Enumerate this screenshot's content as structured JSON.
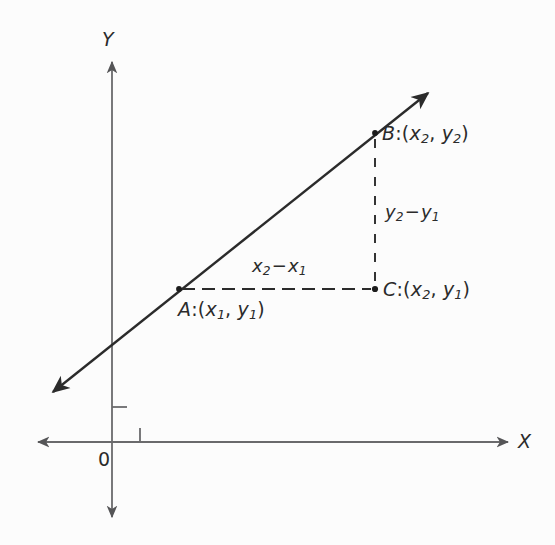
{
  "figure": {
    "kind": "coordinate-geometry-slope-diagram",
    "background_color": "#fcfcfc",
    "ink_color": "#2b2b2b",
    "width": 555,
    "height": 545
  },
  "axes": {
    "x_label": "X",
    "y_label": "Y",
    "origin_label": "0",
    "x_axis": {
      "x1": 38,
      "x2": 508,
      "y": 442,
      "arrows": "both"
    },
    "y_axis": {
      "y1": 62,
      "y2": 517,
      "x": 112,
      "arrows": "both"
    },
    "ticks": [
      {
        "name": "y-axis-tick",
        "axis": "y",
        "x": 112,
        "y": 407,
        "length": 14,
        "direction": "right"
      },
      {
        "name": "x-axis-tick",
        "axis": "x",
        "x": 140,
        "y": 442,
        "length": 14,
        "direction": "up"
      }
    ]
  },
  "line": {
    "name": "secant-line-through-A-and-B",
    "from": {
      "x": 53,
      "y": 392
    },
    "to": {
      "x": 428,
      "y": 93
    },
    "arrows": "both",
    "stroke_width": 2.4
  },
  "points": [
    {
      "id": "A",
      "cx": 179,
      "cy": 289,
      "label_prefix": "A",
      "coord_x": "x",
      "coord_x_sub": "1",
      "coord_y": "y",
      "coord_y_sub": "1"
    },
    {
      "id": "B",
      "cx": 375,
      "cy": 133,
      "label_prefix": "B",
      "coord_x": "x",
      "coord_x_sub": "2",
      "coord_y": "y",
      "coord_y_sub": "2"
    },
    {
      "id": "C",
      "cx": 375,
      "cy": 289,
      "label_prefix": "C",
      "coord_x": "x",
      "coord_x_sub": "2",
      "coord_y": "y",
      "coord_y_sub": "1"
    }
  ],
  "labels": {
    "point_a": "A:(x1, y1)",
    "point_b": "B:(x2, y2)",
    "point_c": "C:(x2, y1)",
    "delta_x": "x2 - x1",
    "delta_y": "y2 - y1",
    "separator_colon": ":",
    "separator_comma": ",",
    "paren_open": "(",
    "paren_close": ")",
    "minus_sign": "−"
  },
  "dashed_segments": [
    {
      "name": "horizontal-leg-A-to-C",
      "x1": 182,
      "y1": 289,
      "x2": 372,
      "y2": 289,
      "dash": "13 7"
    },
    {
      "name": "vertical-leg-B-to-C",
      "x1": 375,
      "y1": 138,
      "x2": 375,
      "y2": 286,
      "dash": "9 9"
    }
  ]
}
